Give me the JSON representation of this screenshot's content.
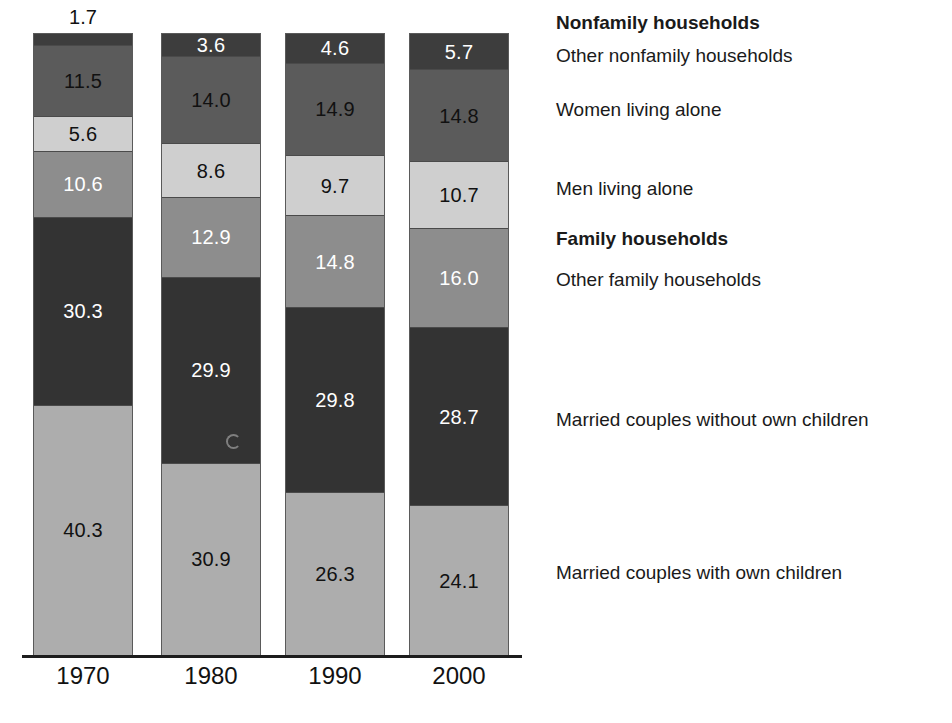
{
  "chart_data": {
    "type": "bar",
    "subtype": "stacked-vertical-100",
    "title": "",
    "xlabel": "",
    "ylabel": "",
    "ylim": [
      0,
      100
    ],
    "grid": false,
    "legend_position": "right",
    "categories": [
      "1970",
      "1980",
      "1990",
      "2000"
    ],
    "series": [
      {
        "name": "Other nonfamily households",
        "values": [
          1.7,
          3.6,
          4.6,
          5.7
        ],
        "color": "#3d3d3d",
        "label_color": "light"
      },
      {
        "name": "Women living alone",
        "values": [
          11.5,
          14.0,
          14.9,
          14.8
        ],
        "color": "#5b5b5b",
        "label_color": "dark"
      },
      {
        "name": "Men living alone",
        "values": [
          5.6,
          8.6,
          9.7,
          10.7
        ],
        "color": "#cfcfcf",
        "label_color": "dark"
      },
      {
        "name": "Other family households",
        "values": [
          10.6,
          12.9,
          14.8,
          16.0
        ],
        "color": "#8d8d8d",
        "label_color": "light"
      },
      {
        "name": "Married couples without own children",
        "values": [
          30.3,
          29.9,
          29.8,
          28.7
        ],
        "color": "#333333",
        "label_color": "light"
      },
      {
        "name": "Married couples with own children",
        "values": [
          40.3,
          30.9,
          26.3,
          24.1
        ],
        "color": "#adadad",
        "label_color": "dark"
      }
    ],
    "value_labels": {
      "1970": [
        "1.7",
        "11.5",
        "5.6",
        "10.6",
        "30.3",
        "40.3"
      ],
      "1980": [
        "3.6",
        "14.0",
        "8.6",
        "12.9",
        "29.9",
        "30.9"
      ],
      "1990": [
        "4.6",
        "14.9",
        "9.7",
        "14.8",
        "29.8",
        "26.3"
      ],
      "2000": [
        "5.7",
        "14.8",
        "10.7",
        "16.0",
        "28.7",
        "24.1"
      ]
    },
    "outside_labels": [
      {
        "category": "1970",
        "series": "Other nonfamily households",
        "text": "1.7"
      }
    ]
  },
  "axis": {
    "ticks": [
      "1970",
      "1980",
      "1990",
      "2000"
    ]
  },
  "legend": {
    "entries": [
      {
        "label": "Nonfamily households",
        "bold": true,
        "top": 12
      },
      {
        "label": "Other nonfamily households",
        "bold": false,
        "top": 45
      },
      {
        "label": "Women living alone",
        "bold": false,
        "top": 99
      },
      {
        "label": "Men living alone",
        "bold": false,
        "top": 178
      },
      {
        "label": "Family households",
        "bold": true,
        "top": 228
      },
      {
        "label": "Other family households",
        "bold": false,
        "top": 269
      },
      {
        "label": "Married couples without own children",
        "bold": false,
        "top": 409
      },
      {
        "label": "Married couples with own children",
        "bold": false,
        "top": 562
      }
    ]
  },
  "bars": [
    {
      "year": "1970",
      "left": 33,
      "width": 100,
      "height": 622
    },
    {
      "year": "1980",
      "left": 161,
      "width": 100,
      "height": 622
    },
    {
      "year": "1990",
      "left": 285,
      "width": 100,
      "height": 622
    },
    {
      "year": "2000",
      "left": 409,
      "width": 100,
      "height": 622
    }
  ]
}
